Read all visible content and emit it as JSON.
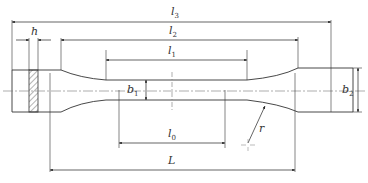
{
  "diagram": {
    "colors": {
      "line": "#333333",
      "hatch": "#444444",
      "centerline": "#777777",
      "background": "#ffffff"
    },
    "labels": {
      "l3": {
        "base": "l",
        "sub": "3"
      },
      "l2": {
        "base": "l",
        "sub": "2"
      },
      "l1": {
        "base": "l",
        "sub": "1"
      },
      "h": {
        "base": "h",
        "sub": ""
      },
      "b1": {
        "base": "b",
        "sub": "1"
      },
      "b2": {
        "base": "b",
        "sub": "2"
      },
      "l0": {
        "base": "l",
        "sub": "0"
      },
      "L": {
        "base": "L",
        "sub": ""
      },
      "r": {
        "base": "r",
        "sub": ""
      }
    },
    "dimensions": [
      {
        "name": "l3",
        "meaning": "total length"
      },
      {
        "name": "l2",
        "meaning": "distance between grip ends"
      },
      {
        "name": "l1",
        "meaning": "parallel length"
      },
      {
        "name": "h",
        "meaning": "grip length"
      },
      {
        "name": "b1",
        "meaning": "gauge width"
      },
      {
        "name": "b2",
        "meaning": "grip width"
      },
      {
        "name": "l0",
        "meaning": "gauge length"
      },
      {
        "name": "L",
        "meaning": "initial grip separation"
      },
      {
        "name": "r",
        "meaning": "fillet radius"
      }
    ]
  }
}
